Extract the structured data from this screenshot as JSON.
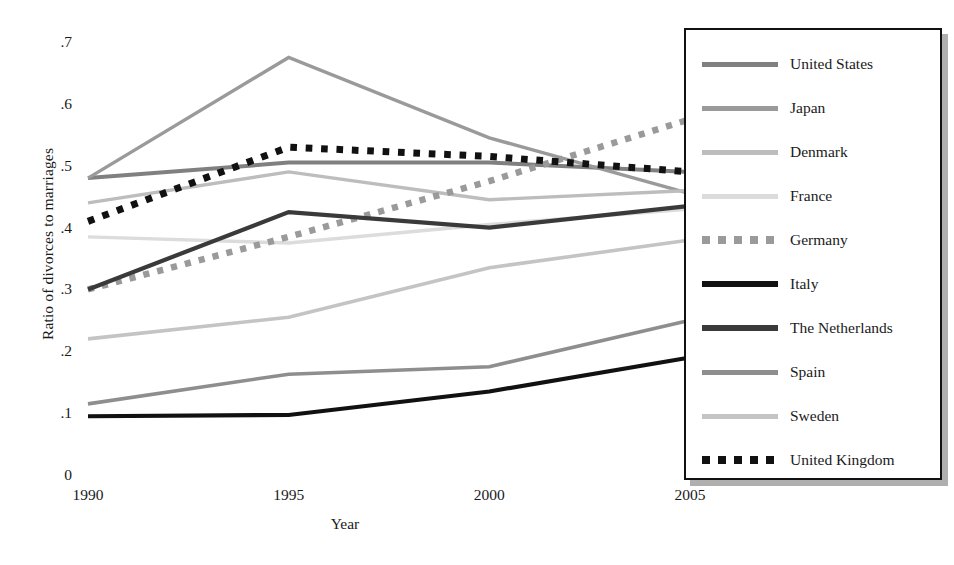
{
  "chart_data": {
    "type": "line",
    "title": "",
    "xlabel": "Year",
    "ylabel": "Ratio of divorces to marriages",
    "x": [
      1990,
      1995,
      2000,
      2005
    ],
    "xtick_labels": [
      ".1990",
      "1995",
      "2000",
      "2005"
    ],
    "xticks": [
      "1990",
      "1995",
      "2000",
      "2005"
    ],
    "yticks": [
      "0",
      ".1",
      ".2",
      ".3",
      ".4",
      ".5",
      ".6",
      ".7"
    ],
    "ytick_values": [
      0,
      0.1,
      0.2,
      0.3,
      0.4,
      0.5,
      0.6,
      0.7
    ],
    "ylim": [
      0,
      0.7
    ],
    "xlim": [
      1990,
      2005
    ],
    "grid": false,
    "legend_position": "right",
    "series": [
      {
        "name": "United States",
        "style": "solid",
        "color": "#808080",
        "width": 4.0,
        "values": [
          0.48,
          0.505,
          0.505,
          0.49
        ]
      },
      {
        "name": "Japan",
        "style": "solid",
        "color": "#9a9a9a",
        "width": 3.4,
        "values": [
          0.48,
          0.675,
          0.545,
          0.455
        ]
      },
      {
        "name": "Denmark",
        "style": "solid",
        "color": "#bdbdbd",
        "width": 3.4,
        "values": [
          0.44,
          0.49,
          0.445,
          0.46
        ]
      },
      {
        "name": "France",
        "style": "solid",
        "color": "#dcdcdc",
        "width": 3.4,
        "values": [
          0.385,
          0.375,
          0.405,
          0.43
        ]
      },
      {
        "name": "Germany",
        "style": "dotted",
        "color": "#9a9a9a",
        "width": 6.5,
        "values": [
          0.3,
          0.385,
          0.475,
          0.575
        ]
      },
      {
        "name": "Italy",
        "style": "solid",
        "color": "#111111",
        "width": 4.2,
        "values": [
          0.095,
          0.097,
          0.135,
          0.19
        ]
      },
      {
        "name": "The Netherlands",
        "style": "solid",
        "color": "#3a3a3a",
        "width": 4.2,
        "values": [
          0.3,
          0.425,
          0.4,
          0.435
        ]
      },
      {
        "name": "Spain",
        "style": "solid",
        "color": "#8e8e8e",
        "width": 3.6,
        "values": [
          0.115,
          0.163,
          0.175,
          0.25
        ]
      },
      {
        "name": "Sweden",
        "style": "solid",
        "color": "#c4c4c4",
        "width": 3.6,
        "values": [
          0.22,
          0.255,
          0.335,
          0.38
        ]
      },
      {
        "name": "United Kingdom",
        "style": "dotted",
        "color": "#111111",
        "width": 7.0,
        "values": [
          0.41,
          0.53,
          0.515,
          0.49
        ]
      }
    ]
  },
  "legend": {
    "items": [
      {
        "label": "United States"
      },
      {
        "label": "Japan"
      },
      {
        "label": "Denmark"
      },
      {
        "label": "France"
      },
      {
        "label": "Germany"
      },
      {
        "label": "Italy"
      },
      {
        "label": "The Netherlands"
      },
      {
        "label": "Spain"
      },
      {
        "label": "Sweden"
      },
      {
        "label": "United Kingdom"
      }
    ]
  },
  "axes": {
    "y_title": "Ratio of divorces to marriages",
    "x_title": "Year"
  }
}
